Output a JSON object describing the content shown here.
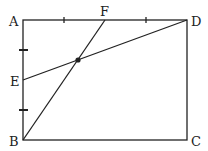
{
  "diagram": {
    "type": "geometry-rectangle",
    "labels": {
      "A": "A",
      "B": "B",
      "C": "C",
      "D": "D",
      "E": "E",
      "F": "F"
    },
    "points": {
      "A": [
        23,
        20
      ],
      "B": [
        23,
        140
      ],
      "C": [
        187,
        140
      ],
      "D": [
        187,
        20
      ],
      "E": [
        23,
        80
      ],
      "F": [
        105,
        20
      ],
      "P": [
        78,
        60
      ]
    },
    "segments": [
      "AD",
      "DC",
      "CB",
      "BA",
      "BF",
      "ED"
    ],
    "tick_marks": {
      "top_side": [
        64,
        146
      ],
      "left_side": [
        50,
        110
      ]
    },
    "stroke_color": "#222222"
  }
}
